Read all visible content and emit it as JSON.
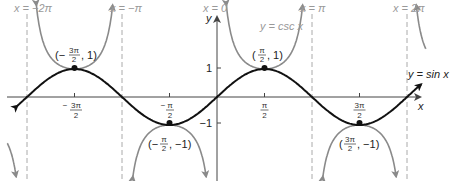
{
  "chart_data": {
    "type": "line",
    "title": "",
    "xlabel": "x",
    "ylabel": "y",
    "xlim": [
      -6.6,
      7.0
    ],
    "ylim": [
      -2.9,
      3.5
    ],
    "grid": false,
    "x_ticks": [
      "-3π/2",
      "-π/2",
      "π/2",
      "3π/2"
    ],
    "x_tick_values": [
      -4.712,
      -1.571,
      1.571,
      4.712
    ],
    "y_ticks": [
      "1",
      "-1"
    ],
    "y_tick_values": [
      1,
      -1
    ],
    "series": [
      {
        "name": "y = sin x",
        "color": "#111111",
        "style": "solid",
        "function": "sin(x)"
      },
      {
        "name": "y = csc x",
        "color": "#8a8a8a",
        "style": "solid",
        "function": "1/sin(x)"
      }
    ],
    "asymptotes": [
      {
        "label": "x = −2π",
        "value": -6.283
      },
      {
        "label": "x = −π",
        "value": -3.142
      },
      {
        "label": "x = 0",
        "value": 0
      },
      {
        "label": "x = π",
        "value": 3.142
      },
      {
        "label": "x = 2π",
        "value": 6.283
      }
    ],
    "points": [
      {
        "label": "(−3π/2, 1)",
        "x": -4.712,
        "y": 1
      },
      {
        "label": "(−π/2, −1)",
        "x": -1.571,
        "y": -1
      },
      {
        "label": "(π/2, 1)",
        "x": 1.571,
        "y": 1
      },
      {
        "label": "(3π/2, −1)",
        "x": 4.712,
        "y": -1
      }
    ],
    "annotations": [
      "y = sin x",
      "y = csc x"
    ]
  },
  "labels": {
    "asym_m2pi": "x = −2π",
    "asym_mpi": "x = −π",
    "asym_0": "x = 0",
    "asym_pi": "x = π",
    "asym_2pi": "x = 2π",
    "csc": "y = csc x",
    "sin": "y = sin x",
    "x_axis": "x",
    "y_axis": "y",
    "y1": "1",
    "ym1": "−1",
    "pt1": "(−3π/2, 1)",
    "pt2": "(−π/2, −1)",
    "pt3": "(π/2, 1)",
    "pt4": "(3π/2, −1)"
  }
}
